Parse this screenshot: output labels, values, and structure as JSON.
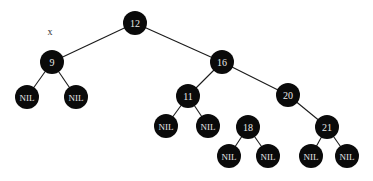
{
  "diagram": {
    "type": "binary-search-tree",
    "pointer_label": {
      "text": "x",
      "x": 50,
      "y": 31,
      "points_to": "9"
    },
    "node_radius": 12,
    "nil_radius": 12,
    "nodes": [
      {
        "id": "12",
        "label": "12",
        "x": 135,
        "y": 23,
        "parent": null
      },
      {
        "id": "9",
        "label": "9",
        "x": 52,
        "y": 62,
        "parent": "12"
      },
      {
        "id": "16",
        "label": "16",
        "x": 222,
        "y": 62,
        "parent": "12"
      },
      {
        "id": "11",
        "label": "11",
        "x": 188,
        "y": 96,
        "parent": "16"
      },
      {
        "id": "20",
        "label": "20",
        "x": 288,
        "y": 95,
        "parent": "16"
      },
      {
        "id": "18",
        "label": "18",
        "x": 248,
        "y": 127,
        "parent": null,
        "note": "drawn with no incoming edge; structurally would be left child of 20"
      },
      {
        "id": "21",
        "label": "21",
        "x": 327,
        "y": 127,
        "parent": "20"
      }
    ],
    "nil_nodes": [
      {
        "id": "nil-9L",
        "label": "NIL",
        "x": 27,
        "y": 97,
        "parent": "9"
      },
      {
        "id": "nil-9R",
        "label": "NIL",
        "x": 76,
        "y": 97,
        "parent": "9"
      },
      {
        "id": "nil-11L",
        "label": "NIL",
        "x": 166,
        "y": 126,
        "parent": "11"
      },
      {
        "id": "nil-11R",
        "label": "NIL",
        "x": 208,
        "y": 126,
        "parent": "11"
      },
      {
        "id": "nil-18L",
        "label": "NIL",
        "x": 229,
        "y": 156,
        "parent": "18"
      },
      {
        "id": "nil-18R",
        "label": "NIL",
        "x": 268,
        "y": 156,
        "parent": "18"
      },
      {
        "id": "nil-21L",
        "label": "NIL",
        "x": 311,
        "y": 156,
        "parent": "21"
      },
      {
        "id": "nil-21R",
        "label": "NIL",
        "x": 347,
        "y": 156,
        "parent": "21"
      }
    ],
    "colors": {
      "node_fill": "#0a0a0a",
      "node_text": "#e8e8e8",
      "edge": "#1a1a1a",
      "background": "#ffffff"
    }
  }
}
